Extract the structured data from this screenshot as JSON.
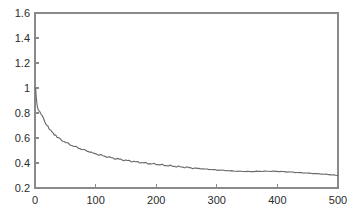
{
  "chart_data": {
    "type": "line",
    "title": "",
    "xlabel": "",
    "ylabel": "",
    "xlim": [
      0,
      500
    ],
    "ylim": [
      0.2,
      1.6
    ],
    "grid": false,
    "legend": null,
    "xticks": [
      0,
      100,
      200,
      300,
      400,
      500
    ],
    "xtick_labels": [
      "0",
      "100",
      "200",
      "300",
      "400",
      "500"
    ],
    "yticks": [
      0.2,
      0.4,
      0.6,
      0.8,
      1.0,
      1.2,
      1.4,
      1.6
    ],
    "ytick_labels": [
      "0.2",
      "0.4",
      "0.6",
      "0.8",
      "1",
      "1.2",
      "1.4",
      "1.6"
    ],
    "line_color": "#6b6b6b",
    "axis_color": "#8a8a8a",
    "background_color": "#ffffff",
    "series": [
      {
        "name": "error",
        "x": [
          1,
          2,
          3,
          4,
          5,
          6,
          7,
          8,
          9,
          10,
          12,
          14,
          16,
          18,
          20,
          23,
          26,
          29,
          32,
          35,
          38,
          42,
          46,
          50,
          54,
          58,
          62,
          66,
          70,
          74,
          78,
          82,
          86,
          90,
          95,
          100,
          106,
          112,
          118,
          124,
          130,
          136,
          142,
          148,
          154,
          160,
          168,
          176,
          184,
          192,
          200,
          210,
          220,
          230,
          240,
          250,
          260,
          270,
          280,
          290,
          300,
          310,
          320,
          330,
          340,
          350,
          360,
          370,
          380,
          390,
          400,
          410,
          420,
          430,
          440,
          450,
          460,
          470,
          480,
          490,
          500
        ],
        "y": [
          1.0,
          0.93,
          0.88,
          0.85,
          0.83,
          0.82,
          0.815,
          0.81,
          0.8,
          0.79,
          0.775,
          0.755,
          0.735,
          0.715,
          0.7,
          0.678,
          0.66,
          0.643,
          0.628,
          0.615,
          0.603,
          0.59,
          0.578,
          0.566,
          0.556,
          0.547,
          0.538,
          0.53,
          0.523,
          0.516,
          0.509,
          0.502,
          0.496,
          0.49,
          0.482,
          0.474,
          0.466,
          0.458,
          0.451,
          0.444,
          0.438,
          0.433,
          0.428,
          0.423,
          0.418,
          0.414,
          0.408,
          0.403,
          0.398,
          0.394,
          0.39,
          0.384,
          0.379,
          0.374,
          0.369,
          0.365,
          0.36,
          0.356,
          0.352,
          0.348,
          0.344,
          0.341,
          0.338,
          0.335,
          0.333,
          0.332,
          0.332,
          0.333,
          0.334,
          0.334,
          0.333,
          0.331,
          0.328,
          0.325,
          0.322,
          0.319,
          0.316,
          0.313,
          0.31,
          0.305,
          0.3
        ]
      }
    ]
  }
}
